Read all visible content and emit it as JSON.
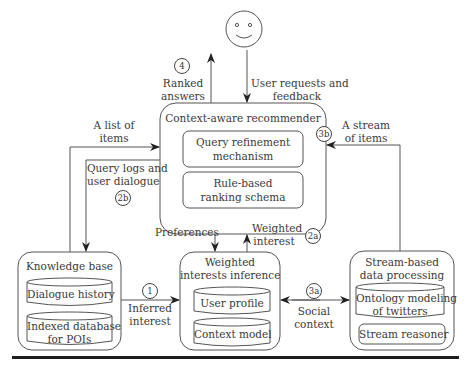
{
  "diagram": {
    "user": {
      "icon": "smiley-face-user"
    },
    "context_aware_recommender": {
      "title": "Context-aware recommender",
      "components": [
        "Query refinement\nmechanism",
        "Rule-based\nranking schema"
      ],
      "comp1_line1": "Query refinement",
      "comp1_line2": "mechanism",
      "comp2_line1": "Rule-based",
      "comp2_line2": "ranking schema"
    },
    "knowledge_base": {
      "title": "Knowledge base",
      "db1": "Dialogue history",
      "db2_line1": "Indexed database",
      "db2_line2": "for POIs"
    },
    "weighted_interests_inference": {
      "title_line1": "Weighted",
      "title_line2": "interests inference",
      "db1": "User profile",
      "db2": "Context model"
    },
    "stream_based_processing": {
      "title_line1": "Stream-based",
      "title_line2": "data processing",
      "db1_line1": "Ontology modeling",
      "db1_line2": "of twitters",
      "comp": "Stream reasoner"
    },
    "edges": {
      "ranked_answers": {
        "step": "4",
        "line1": "Ranked",
        "line2": "answers"
      },
      "user_requests": {
        "line1": "User requests and",
        "line2": "feedback"
      },
      "list_of_items": {
        "line1": "A list of",
        "line2": "items"
      },
      "query_logs": {
        "step": "2b",
        "line1": "Query logs and",
        "line2": "user dialogue"
      },
      "stream_of_items": {
        "step": "3b",
        "line1": "A stream",
        "line2": "of items"
      },
      "preferences": {
        "label": "Preferences"
      },
      "weighted_interest": {
        "step": "2a",
        "line1": "Weighted",
        "line2": "interest"
      },
      "inferred_interest": {
        "step": "1",
        "line1": "Inferred",
        "line2": "interest"
      },
      "social_context": {
        "step": "3a",
        "line1": "Social",
        "line2": "context"
      }
    }
  }
}
